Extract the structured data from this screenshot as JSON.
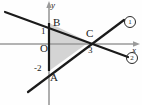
{
  "figure": {
    "kind": "coordinate-geometry-diagram",
    "background_color": "#fefefe",
    "axis_color": "#9a9a9a",
    "line_color": "#1b1b1b",
    "fill_color": "#cccccc",
    "fill_opacity": 0.85,
    "text_color": "#1b1b1b"
  },
  "axes": {
    "x_label": "x",
    "y_label": "y",
    "origin_label": "O",
    "x_axis_pixel_y": 44,
    "y_axis_pixel_x": 49,
    "unit_px": 13
  },
  "ticks": [
    {
      "name": "y-tick-1",
      "label": "1",
      "axis": "y",
      "value": 1,
      "px": {
        "x": 41,
        "y": 27
      }
    },
    {
      "name": "y-tick-neg2",
      "label": "-2",
      "axis": "y",
      "value": -2,
      "px": {
        "x": 36,
        "y": 64
      }
    },
    {
      "name": "x-tick-3",
      "label": "3",
      "axis": "x",
      "value": 3,
      "px": {
        "x": 89,
        "y": 46
      }
    }
  ],
  "points": [
    {
      "name": "A",
      "label": "A",
      "coords": {
        "x": 0,
        "y": -2
      },
      "px": {
        "x": 49,
        "y": 71
      },
      "label_px": {
        "x": 49,
        "y": 72
      }
    },
    {
      "name": "B",
      "label": "B",
      "coords": {
        "x": 0,
        "y": 1.6
      },
      "px": {
        "x": 49,
        "y": 23
      },
      "label_px": {
        "x": 53,
        "y": 19
      }
    },
    {
      "name": "C",
      "label": "C",
      "coords": {
        "x": 3,
        "y": 1
      },
      "px": {
        "x": 89,
        "y": 42
      },
      "label_px": {
        "x": 87,
        "y": 30
      }
    }
  ],
  "lines": [
    {
      "name": "line-1-ascending",
      "label": "①",
      "badge": "1",
      "description": "ascending line through A(0,-2) and C",
      "from_px": {
        "x": 28,
        "y": 92
      },
      "to_px": {
        "x": 124,
        "y": 20
      },
      "label_px": {
        "x": 124,
        "y": 18
      }
    },
    {
      "name": "line-2-descending",
      "label": "②",
      "badge": "2",
      "description": "descending line through B and C",
      "from_px": {
        "x": 5,
        "y": 12
      },
      "to_px": {
        "x": 128,
        "y": 57
      },
      "label_px": {
        "x": 127,
        "y": 53
      }
    }
  ],
  "triangle": {
    "name": "triangle-ABC",
    "vertices": [
      "A",
      "B",
      "C"
    ],
    "points_px": "49,71 49,23 89,42"
  }
}
